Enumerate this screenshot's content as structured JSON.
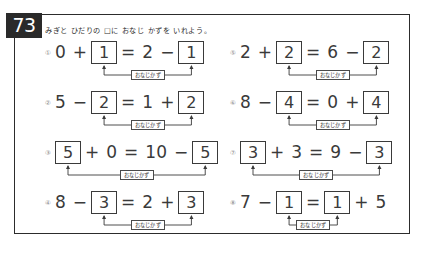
{
  "page": {
    "number": "73",
    "instruction": "みぎと ひだりの □に おなじ かずを いれよう。",
    "same_number_label": "おなじかず"
  },
  "problems": {
    "left": [
      {
        "marker": "①",
        "parts": [
          {
            "kind": "term",
            "text": "0"
          },
          {
            "kind": "op",
            "text": "+"
          },
          {
            "kind": "box",
            "text": "1"
          },
          {
            "kind": "op",
            "text": "="
          },
          {
            "kind": "term",
            "text": "2"
          },
          {
            "kind": "op",
            "text": "−"
          },
          {
            "kind": "box",
            "text": "1"
          }
        ]
      },
      {
        "marker": "②",
        "parts": [
          {
            "kind": "term",
            "text": "5"
          },
          {
            "kind": "op",
            "text": "−"
          },
          {
            "kind": "box",
            "text": "2"
          },
          {
            "kind": "op",
            "text": "="
          },
          {
            "kind": "term",
            "text": "1"
          },
          {
            "kind": "op",
            "text": "+"
          },
          {
            "kind": "box",
            "text": "2"
          }
        ]
      },
      {
        "marker": "③",
        "parts": [
          {
            "kind": "box",
            "text": "5"
          },
          {
            "kind": "op",
            "text": "+"
          },
          {
            "kind": "term",
            "text": "0"
          },
          {
            "kind": "op",
            "text": "="
          },
          {
            "kind": "term",
            "text": "10"
          },
          {
            "kind": "op",
            "text": "−"
          },
          {
            "kind": "box",
            "text": "5"
          }
        ]
      },
      {
        "marker": "④",
        "parts": [
          {
            "kind": "term",
            "text": "8"
          },
          {
            "kind": "op",
            "text": "−"
          },
          {
            "kind": "box",
            "text": "3"
          },
          {
            "kind": "op",
            "text": "="
          },
          {
            "kind": "term",
            "text": "2"
          },
          {
            "kind": "op",
            "text": "+"
          },
          {
            "kind": "box",
            "text": "3"
          }
        ]
      }
    ],
    "right": [
      {
        "marker": "⑤",
        "parts": [
          {
            "kind": "term",
            "text": "2"
          },
          {
            "kind": "op",
            "text": "+"
          },
          {
            "kind": "box",
            "text": "2"
          },
          {
            "kind": "op",
            "text": "="
          },
          {
            "kind": "term",
            "text": "6"
          },
          {
            "kind": "op",
            "text": "−"
          },
          {
            "kind": "box",
            "text": "2"
          }
        ]
      },
      {
        "marker": "⑥",
        "parts": [
          {
            "kind": "term",
            "text": "8"
          },
          {
            "kind": "op",
            "text": "−"
          },
          {
            "kind": "box",
            "text": "4"
          },
          {
            "kind": "op",
            "text": "="
          },
          {
            "kind": "term",
            "text": "0"
          },
          {
            "kind": "op",
            "text": "+"
          },
          {
            "kind": "box",
            "text": "4"
          }
        ]
      },
      {
        "marker": "⑦",
        "parts": [
          {
            "kind": "box",
            "text": "3"
          },
          {
            "kind": "op",
            "text": "+"
          },
          {
            "kind": "term",
            "text": "3"
          },
          {
            "kind": "op",
            "text": "="
          },
          {
            "kind": "term",
            "text": "9"
          },
          {
            "kind": "op",
            "text": "−"
          },
          {
            "kind": "box",
            "text": "3"
          }
        ]
      },
      {
        "marker": "⑧",
        "parts": [
          {
            "kind": "term",
            "text": "7"
          },
          {
            "kind": "op",
            "text": "−"
          },
          {
            "kind": "box",
            "text": "1"
          },
          {
            "kind": "op",
            "text": "="
          },
          {
            "kind": "box",
            "text": "1"
          },
          {
            "kind": "op",
            "text": "+"
          },
          {
            "kind": "term",
            "text": "5"
          }
        ]
      }
    ]
  },
  "colors": {
    "ink": "#3a3a3a",
    "frame": "#2c2c2c",
    "badge_bg": "#2a2a2a",
    "badge_fg": "#ffffff",
    "marker": "#8a8a8a"
  }
}
